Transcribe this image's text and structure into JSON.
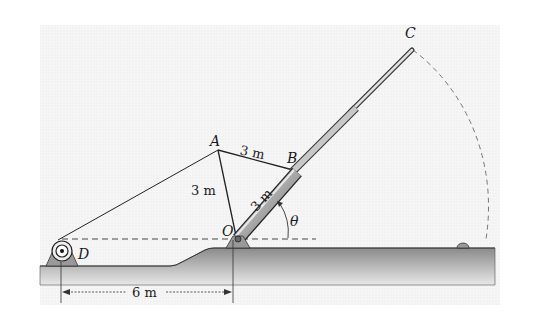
{
  "diagram": {
    "type": "mechanism",
    "points": {
      "A": {
        "label": "A"
      },
      "B": {
        "label": "B"
      },
      "C": {
        "label": "C"
      },
      "D": {
        "label": "D"
      },
      "O": {
        "label": "O"
      }
    },
    "dimensions": {
      "AB": "3 m",
      "AO": "3 m",
      "OB": "3 m",
      "DO_horizontal": "6 m"
    },
    "angle_label": "θ",
    "colors": {
      "background_panel": "#f3f3f3",
      "ground": "#9a9a9a",
      "ground_dark": "#7a7a7a",
      "line": "#222222",
      "boom_fill": "#b8b8b8"
    }
  }
}
